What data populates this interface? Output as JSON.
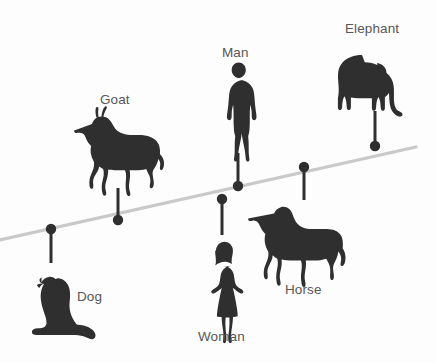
{
  "figure": {
    "background_color": "#fdfdfd",
    "silhouette_color": "#2f2f2f",
    "label_color": "#575757",
    "trend_line_color": "#c9c9c9",
    "marker_color": "#2f2f2f"
  },
  "chart_data": {
    "type": "scatter",
    "title": "",
    "subtitle": "",
    "xlabel": "",
    "ylabel": "",
    "grid": false,
    "legend": "none",
    "trend_line": {
      "x1": 0,
      "y1": 240,
      "x2": 416,
      "y2": 147,
      "slope_direction": "upward-right"
    },
    "categories": [
      "Dog",
      "Goat",
      "Woman",
      "Man",
      "Horse",
      "Elephant"
    ],
    "points": [
      {
        "label": "Dog",
        "icon": "dog-silhouette",
        "marker_x": 51,
        "marker_y": 229,
        "stem_end_y": 263,
        "stem_direction": "down",
        "label_x": 77,
        "label_y": 290,
        "silhouette_x": 21,
        "silhouette_y": 277,
        "silhouette_w": 72,
        "silhouette_h": 62
      },
      {
        "label": "Goat",
        "icon": "goat-silhouette",
        "marker_x": 118,
        "marker_y": 220,
        "stem_end_y": 188,
        "stem_direction": "up",
        "label_x": 100,
        "label_y": 93,
        "silhouette_x": 78,
        "silhouette_y": 110,
        "silhouette_w": 80,
        "silhouette_h": 68
      },
      {
        "label": "Woman",
        "icon": "woman-silhouette",
        "marker_x": 222,
        "marker_y": 199,
        "stem_end_y": 235,
        "stem_direction": "down",
        "label_x": 198,
        "label_y": 330,
        "silhouette_x": 203,
        "silhouette_y": 240,
        "silhouette_w": 40,
        "silhouette_h": 82
      },
      {
        "label": "Man",
        "icon": "man-silhouette",
        "marker_x": 238,
        "marker_y": 186,
        "stem_end_y": 153,
        "stem_direction": "up",
        "label_x": 222,
        "label_y": 46,
        "silhouette_x": 222,
        "silhouette_y": 62,
        "silhouette_w": 34,
        "silhouette_h": 84
      },
      {
        "label": "Horse",
        "icon": "horse-silhouette",
        "marker_x": 304,
        "marker_y": 167,
        "stem_end_y": 200,
        "stem_direction": "down",
        "label_x": 285,
        "label_y": 283,
        "silhouette_x": 266,
        "silhouette_y": 205,
        "silhouette_w": 75,
        "silhouette_h": 65
      },
      {
        "label": "Elephant",
        "icon": "elephant-silhouette",
        "marker_x": 375,
        "marker_y": 146,
        "stem_end_y": 111,
        "stem_direction": "up",
        "label_x": 345,
        "label_y": 22,
        "silhouette_x": 339,
        "silhouette_y": 48,
        "silhouette_w": 93,
        "silhouette_h": 60
      }
    ]
  }
}
